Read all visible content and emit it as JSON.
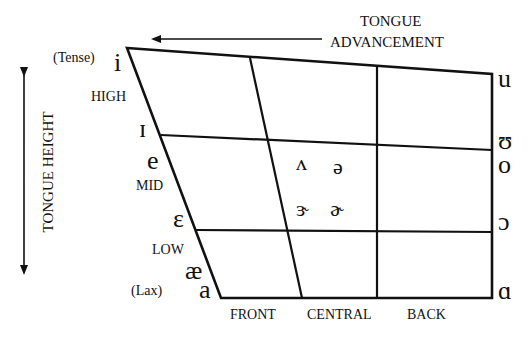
{
  "axes": {
    "horizontal": {
      "label_line1": "TONGUE",
      "label_line2": "ADVANCEMENT",
      "arrow_direction": "left"
    },
    "vertical": {
      "label": "TONGUE HEIGHT",
      "arrow_direction": "both"
    }
  },
  "height_labels": {
    "tense": "(Tense)",
    "high": "HIGH",
    "mid": "MID",
    "low": "LOW",
    "lax": "(Lax)"
  },
  "advancement_labels": {
    "front": "FRONT",
    "central": "CENTRAL",
    "back": "BACK"
  },
  "front_vowels": [
    "i",
    "ɪ",
    "e",
    "ɛ",
    "æ",
    "a"
  ],
  "central_vowels": [
    "ʌ",
    "ə",
    "ɝ",
    "ɚ"
  ],
  "back_vowels": [
    "u",
    "ʊ",
    "o",
    "ɔ",
    "ɑ"
  ],
  "colors": {
    "line": "#111111",
    "background": "#ffffff"
  }
}
